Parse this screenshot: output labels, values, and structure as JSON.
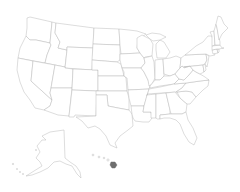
{
  "map": {
    "type": "choropleth",
    "region": "United States",
    "background": "#ffffff",
    "stroke_color": "#b4b4b4",
    "default_fill": "#ffffff",
    "highlight_fill": "#6e6e6e",
    "highlighted_states": [
      "Hawaii"
    ],
    "states": [
      "Washington",
      "Oregon",
      "California",
      "Idaho",
      "Nevada",
      "Montana",
      "Wyoming",
      "Utah",
      "Arizona",
      "Colorado",
      "New Mexico",
      "North Dakota",
      "South Dakota",
      "Nebraska",
      "Kansas",
      "Oklahoma",
      "Texas",
      "Minnesota",
      "Iowa",
      "Missouri",
      "Arkansas",
      "Louisiana",
      "Wisconsin",
      "Illinois",
      "Michigan",
      "Indiana",
      "Ohio",
      "Kentucky",
      "Tennessee",
      "Mississippi",
      "Alabama",
      "Georgia",
      "Florida",
      "South Carolina",
      "North Carolina",
      "Virginia",
      "West Virginia",
      "Maryland",
      "Delaware",
      "Pennsylvania",
      "New Jersey",
      "New York",
      "Connecticut",
      "Rhode Island",
      "Massachusetts",
      "Vermont",
      "New Hampshire",
      "Maine",
      "Alaska",
      "Hawaii"
    ]
  }
}
